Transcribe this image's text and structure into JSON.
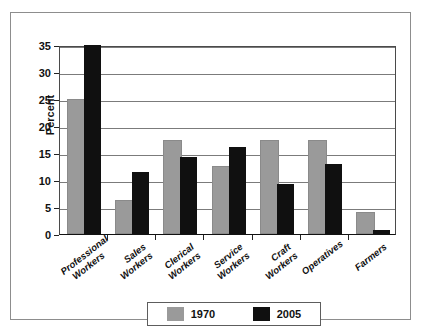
{
  "chart_data": {
    "type": "bar",
    "title": "",
    "xlabel": "",
    "ylabel": "Percent",
    "ylim": [
      0,
      35
    ],
    "yticks": [
      0,
      5,
      10,
      15,
      20,
      25,
      30,
      35
    ],
    "grid": true,
    "legend_position": "bottom-center",
    "categories": [
      "Professional Workers",
      "Sales Workers",
      "Clerical Workers",
      "Service Workers",
      "Craft Workers",
      "Operatives",
      "Farmers"
    ],
    "series": [
      {
        "name": "1970",
        "color": "#9a9a9a",
        "values": [
          24.7,
          6.0,
          17.0,
          12.2,
          17.0,
          17.0,
          3.7
        ]
      },
      {
        "name": "2005",
        "color": "#101010",
        "values": [
          35.0,
          11.5,
          14.3,
          16.1,
          9.3,
          12.9,
          0.8
        ]
      }
    ]
  },
  "axis": {
    "y_title": "Percent",
    "y_tick_labels": [
      "0",
      "5",
      "10",
      "15",
      "20",
      "25",
      "30",
      "35"
    ],
    "x_tick_labels": [
      "Professional\nWorkers",
      "Sales\nWorkers",
      "Clerical\nWorkers",
      "Service\nWorkers",
      "Craft\nWorkers",
      "Operatives",
      "Farmers"
    ]
  },
  "legend": {
    "entries": [
      {
        "label": "1970",
        "swatch": "gray-swatch-icon"
      },
      {
        "label": "2005",
        "swatch": "black-swatch-icon"
      }
    ]
  }
}
